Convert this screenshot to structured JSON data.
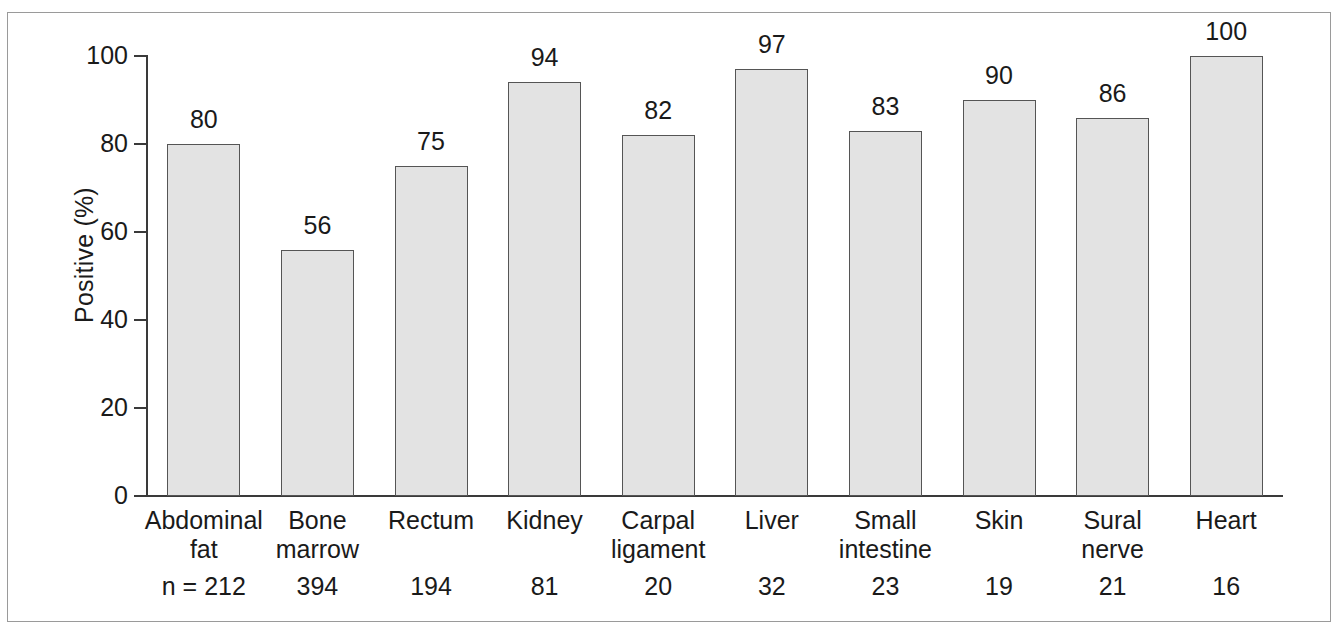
{
  "chart_data": {
    "type": "bar",
    "title": "",
    "xlabel": "",
    "ylabel": "Positive (%)",
    "ylim": [
      0,
      100
    ],
    "grid": false,
    "legend": null,
    "categories": [
      "Abdominal fat",
      "Bone marrow",
      "Rectum",
      "Kidney",
      "Carpal ligament",
      "Liver",
      "Small intestine",
      "Skin",
      "Sural nerve",
      "Heart"
    ],
    "values": [
      80,
      56,
      75,
      94,
      82,
      97,
      83,
      90,
      86,
      100
    ],
    "value_labels": [
      "80",
      "56",
      "75",
      "94",
      "82",
      "97",
      "83",
      "90",
      "86",
      "100"
    ],
    "sample_sizes": [
      212,
      394,
      194,
      81,
      20,
      32,
      23,
      19,
      21,
      16
    ],
    "sample_size_labels": [
      "n = 212",
      "394",
      "194",
      "81",
      "20",
      "32",
      "23",
      "19",
      "21",
      "16"
    ],
    "y_ticks": [
      0,
      20,
      40,
      60,
      80,
      100
    ],
    "y_tick_labels": [
      "0",
      "20",
      "40",
      "60",
      "80",
      "100"
    ],
    "bar_fill_color": "#e3e3e3",
    "bar_edge_color": "#555555",
    "axis_color": "#3a3a3a",
    "frame_color": "#9a9a9a",
    "text_color": "#1a1a1a"
  },
  "axis": {
    "y_title": "Positive (%)",
    "ticks": [
      {
        "label": "100",
        "value": 100
      },
      {
        "label": "80",
        "value": 80
      },
      {
        "label": "60",
        "value": 60
      },
      {
        "label": "40",
        "value": 40
      },
      {
        "label": "20",
        "value": 20
      },
      {
        "label": "0",
        "value": 0
      }
    ]
  },
  "bars": [
    {
      "category_line1": "Abdominal",
      "category_line2": "fat",
      "value_label": "80",
      "n_label": "n = 212"
    },
    {
      "category_line1": "Bone",
      "category_line2": "marrow",
      "value_label": "56",
      "n_label": "394"
    },
    {
      "category_line1": "Rectum",
      "category_line2": "",
      "value_label": "75",
      "n_label": "194"
    },
    {
      "category_line1": "Kidney",
      "category_line2": "",
      "value_label": "94",
      "n_label": "81"
    },
    {
      "category_line1": "Carpal",
      "category_line2": "ligament",
      "value_label": "82",
      "n_label": "20"
    },
    {
      "category_line1": "Liver",
      "category_line2": "",
      "value_label": "97",
      "n_label": "32"
    },
    {
      "category_line1": "Small",
      "category_line2": "intestine",
      "value_label": "83",
      "n_label": "23"
    },
    {
      "category_line1": "Skin",
      "category_line2": "",
      "value_label": "90",
      "n_label": "19"
    },
    {
      "category_line1": "Sural",
      "category_line2": "nerve",
      "value_label": "86",
      "n_label": "21"
    },
    {
      "category_line1": "Heart",
      "category_line2": "",
      "value_label": "100",
      "n_label": "16"
    }
  ]
}
